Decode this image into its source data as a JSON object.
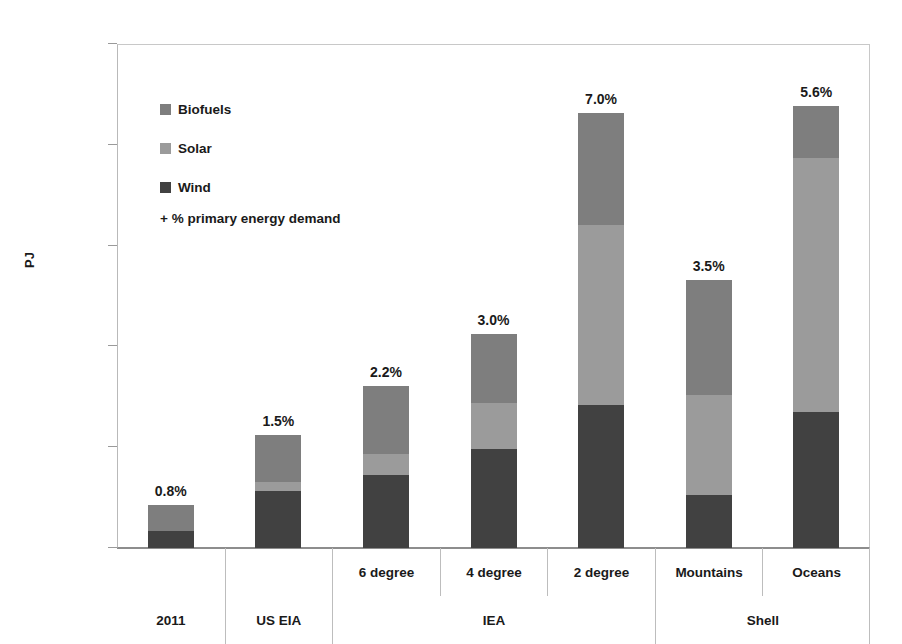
{
  "chart_data": {
    "type": "bar",
    "subtype": "stacked-bar",
    "title": "",
    "xlabel": "",
    "ylabel": "PJ",
    "ylim": [
      0,
      50000
    ],
    "ytick_labels": [
      "50 000",
      "40 000",
      "30 000",
      "20 000",
      "10 000",
      "0"
    ],
    "ytick_values": [
      50000,
      40000,
      30000,
      20000,
      10000,
      0
    ],
    "grid": false,
    "legend_position": "inside-top-left",
    "legend_note": "+ % primary energy demand",
    "categories": [
      "2011",
      "US EIA",
      "6 degree",
      "4 degree",
      "2 degree",
      "Mountains",
      "Oceans"
    ],
    "groups": [
      {
        "label": "2011",
        "span": 1
      },
      {
        "label": "US EIA",
        "span": 1
      },
      {
        "label": "IEA",
        "span": 3
      },
      {
        "label": "Shell",
        "span": 2
      }
    ],
    "subcategories": [
      "",
      "",
      "6 degree",
      "4 degree",
      "2 degree",
      "Mountains",
      "Oceans"
    ],
    "series": [
      {
        "name": "Wind",
        "color": "#414141",
        "values": [
          1700,
          5700,
          7200,
          9800,
          14200,
          5300,
          13500
        ]
      },
      {
        "name": "Solar",
        "color": "#9b9b9b",
        "values": [
          0,
          800,
          2100,
          4600,
          17800,
          9900,
          25200
        ]
      },
      {
        "name": "Biofuels",
        "color": "#7e7e7e",
        "values": [
          2600,
          4700,
          6800,
          6800,
          11200,
          11400,
          5200
        ]
      }
    ],
    "totals": [
      4300,
      11200,
      16100,
      21200,
      43200,
      26600,
      43900
    ],
    "data_labels": [
      "0.8%",
      "1.5%",
      "2.2%",
      "3.0%",
      "7.0%",
      "3.5%",
      "5.6%"
    ],
    "legend": [
      {
        "label": "Biofuels",
        "color": "#7e7e7e"
      },
      {
        "label": "Solar",
        "color": "#9b9b9b"
      },
      {
        "label": "Wind",
        "color": "#414141"
      }
    ]
  }
}
